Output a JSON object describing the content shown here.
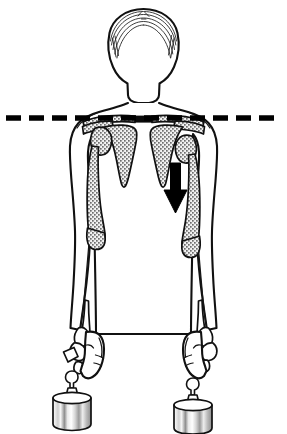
{
  "figure": {
    "type": "anatomical-line-drawing",
    "view": "anterior",
    "background_color": "#ffffff",
    "ink_color": "#111111",
    "bone_fill_color": "#b8b8b8",
    "canvas": {
      "width": 287,
      "height": 434
    }
  },
  "reference_line": {
    "name": "clavicle-reference-line",
    "style": "dashed",
    "orientation": "horizontal",
    "color": "#000000",
    "y": 118,
    "x_start": 6,
    "x_end": 281,
    "dash_length": 15,
    "gap_length": 8,
    "thickness": 5,
    "label": ""
  },
  "arrow": {
    "name": "inferior-displacement-arrow",
    "direction": "down",
    "color": "#000000",
    "side": "patient-left",
    "x": 175,
    "y_start": 163,
    "y_end": 213,
    "label": ""
  },
  "subject": {
    "head": {
      "name": "head",
      "hair": "short-arcing-strokes"
    },
    "neck": {
      "name": "neck"
    },
    "torso": {
      "name": "torso"
    },
    "arms": [
      {
        "name": "right-arm",
        "position": "viewer-left",
        "shoulder_state": "normal",
        "humeral_head": "seated-in-glenoid",
        "holding_weight": true
      },
      {
        "name": "left-arm",
        "position": "viewer-right",
        "shoulder_state": "inferiorly-subluxed",
        "humeral_head": "displaced-downward",
        "holding_weight": true
      }
    ]
  },
  "bones": [
    {
      "name": "clavicle-right",
      "side": "viewer-left"
    },
    {
      "name": "clavicle-left",
      "side": "viewer-right"
    },
    {
      "name": "scapula-right",
      "side": "viewer-left"
    },
    {
      "name": "scapula-left",
      "side": "viewer-right"
    },
    {
      "name": "humerus-right",
      "side": "viewer-left"
    },
    {
      "name": "humerus-left",
      "side": "viewer-right"
    },
    {
      "name": "radius-ulna-right",
      "side": "viewer-left"
    },
    {
      "name": "radius-ulna-left",
      "side": "viewer-right"
    },
    {
      "name": "carpals-right",
      "side": "viewer-left"
    },
    {
      "name": "carpals-left",
      "side": "viewer-right"
    }
  ],
  "weights": [
    {
      "name": "weight-right",
      "side": "viewer-left",
      "shape": "cylinder-with-knob",
      "label": "",
      "center_x": 72,
      "top_y": 393
    },
    {
      "name": "weight-left",
      "side": "viewer-right",
      "shape": "cylinder-with-knob",
      "label": "",
      "center_x": 193,
      "top_y": 400
    }
  ],
  "caption": {
    "text": ""
  }
}
